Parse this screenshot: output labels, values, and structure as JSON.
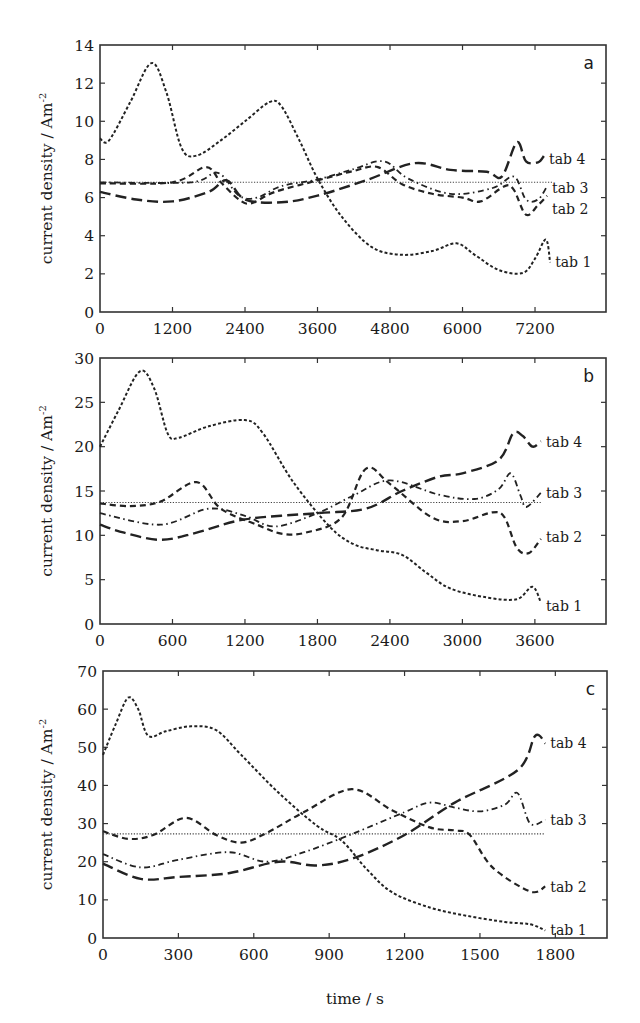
{
  "figure": {
    "x_axis_title": "time / s",
    "y_axis_title": "current density / Am",
    "y_axis_title_sup": "-2"
  },
  "chart_data": [
    {
      "type": "line",
      "panel": "a",
      "title": "",
      "xlabel": "",
      "ylabel": "current density / Am-2",
      "xlim": [
        0,
        8400
      ],
      "ylim": [
        0,
        14
      ],
      "xticks": [
        0,
        1200,
        2400,
        3600,
        4800,
        6000,
        7200
      ],
      "yticks": [
        0,
        2,
        4,
        6,
        8,
        10,
        12,
        14
      ],
      "grid": false,
      "legend": "inline labels at right end of curves",
      "reference_line": {
        "value": 6.8,
        "x_end": 7500,
        "style": "dotted"
      },
      "series": [
        {
          "name": "tab 1",
          "style": "short-dash",
          "label_value": 2.6,
          "points": [
            [
              0,
              9.1
            ],
            [
              150,
              9
            ],
            [
              500,
              11
            ],
            [
              850,
              13.05
            ],
            [
              1100,
              11.5
            ],
            [
              1350,
              8.6
            ],
            [
              1600,
              8.2
            ],
            [
              2000,
              9
            ],
            [
              2400,
              10
            ],
            [
              2800,
              11
            ],
            [
              3000,
              10.8
            ],
            [
              3300,
              9
            ],
            [
              3600,
              7
            ],
            [
              4000,
              5
            ],
            [
              4500,
              3.4
            ],
            [
              5000,
              3
            ],
            [
              5500,
              3.2
            ],
            [
              5900,
              3.6
            ],
            [
              6200,
              3
            ],
            [
              6600,
              2.2
            ],
            [
              7000,
              2.05
            ],
            [
              7200,
              2.8
            ],
            [
              7380,
              3.8
            ],
            [
              7450,
              2.6
            ]
          ]
        },
        {
          "name": "tab 2",
          "style": "medium-dash",
          "label_value": 5.4,
          "points": [
            [
              0,
              6.75
            ],
            [
              1200,
              6.8
            ],
            [
              1750,
              7.6
            ],
            [
              2000,
              6.8
            ],
            [
              2300,
              5.9
            ],
            [
              2500,
              5.7
            ],
            [
              2900,
              6.3
            ],
            [
              3600,
              6.9
            ],
            [
              4200,
              7.4
            ],
            [
              4600,
              7.6
            ],
            [
              5000,
              6.7
            ],
            [
              5500,
              6.2
            ],
            [
              6000,
              6
            ],
            [
              6300,
              5.8
            ],
            [
              6700,
              6.6
            ],
            [
              6850,
              6.4
            ],
            [
              7050,
              5.1
            ],
            [
              7250,
              5.6
            ],
            [
              7400,
              6.1
            ]
          ]
        },
        {
          "name": "tab 3",
          "style": "dash-dot",
          "label_value": 6.5,
          "points": [
            [
              0,
              6.8
            ],
            [
              1500,
              6.8
            ],
            [
              1950,
              7.3
            ],
            [
              2300,
              6.1
            ],
            [
              2600,
              6.0
            ],
            [
              3000,
              6.6
            ],
            [
              3600,
              6.95
            ],
            [
              4200,
              7.5
            ],
            [
              4700,
              7.9
            ],
            [
              5100,
              7.0
            ],
            [
              5800,
              6.2
            ],
            [
              6500,
              6.5
            ],
            [
              6850,
              7.1
            ],
            [
              7050,
              5.9
            ],
            [
              7250,
              5.9
            ],
            [
              7400,
              6.6
            ]
          ]
        },
        {
          "name": "tab 4",
          "style": "long-dash",
          "label_value": 8.0,
          "points": [
            [
              0,
              6.3
            ],
            [
              600,
              5.9
            ],
            [
              1200,
              5.8
            ],
            [
              1800,
              6.3
            ],
            [
              2100,
              6.9
            ],
            [
              2400,
              5.9
            ],
            [
              3000,
              5.75
            ],
            [
              3600,
              6.1
            ],
            [
              4400,
              6.9
            ],
            [
              5200,
              7.8
            ],
            [
              5800,
              7.45
            ],
            [
              6400,
              7.35
            ],
            [
              6650,
              7.1
            ],
            [
              6900,
              8.9
            ],
            [
              7050,
              7.9
            ],
            [
              7250,
              7.85
            ],
            [
              7350,
              8.2
            ]
          ]
        }
      ]
    },
    {
      "type": "line",
      "panel": "b",
      "title": "",
      "xlabel": "",
      "ylabel": "current density / Am-2",
      "xlim": [
        0,
        4200
      ],
      "ylim": [
        0,
        30
      ],
      "xticks": [
        0,
        600,
        1200,
        1800,
        2400,
        3000,
        3600
      ],
      "yticks": [
        0,
        5,
        10,
        15,
        20,
        25,
        30
      ],
      "grid": false,
      "legend": "inline labels at right end of curves",
      "reference_line": {
        "value": 13.7,
        "x_end": 3650,
        "style": "dotted"
      },
      "series": [
        {
          "name": "tab 1",
          "style": "short-dash",
          "label_value": 2.0,
          "points": [
            [
              0,
              20
            ],
            [
              150,
              24
            ],
            [
              330,
              28.5
            ],
            [
              450,
              26.5
            ],
            [
              560,
              21.5
            ],
            [
              650,
              21
            ],
            [
              900,
              22.3
            ],
            [
              1200,
              23
            ],
            [
              1350,
              21.5
            ],
            [
              1600,
              16
            ],
            [
              1900,
              11
            ],
            [
              2100,
              9
            ],
            [
              2300,
              8.3
            ],
            [
              2500,
              7.8
            ],
            [
              2700,
              5.8
            ],
            [
              2900,
              4
            ],
            [
              3200,
              3
            ],
            [
              3450,
              2.8
            ],
            [
              3580,
              4.2
            ],
            [
              3650,
              2.4
            ]
          ]
        },
        {
          "name": "tab 2",
          "style": "medium-dash",
          "label_value": 9.8,
          "points": [
            [
              0,
              13.6
            ],
            [
              250,
              13.3
            ],
            [
              500,
              13.8
            ],
            [
              800,
              16
            ],
            [
              1000,
              13
            ],
            [
              1300,
              11.2
            ],
            [
              1500,
              10.2
            ],
            [
              1700,
              10.3
            ],
            [
              2000,
              12
            ],
            [
              2200,
              17.5
            ],
            [
              2400,
              15.8
            ],
            [
              2750,
              12
            ],
            [
              3000,
              11.6
            ],
            [
              3250,
              12.6
            ],
            [
              3350,
              12
            ],
            [
              3450,
              8.6
            ],
            [
              3550,
              8
            ],
            [
              3650,
              9.6
            ]
          ]
        },
        {
          "name": "tab 3",
          "style": "dash-dot",
          "label_value": 14.8,
          "points": [
            [
              0,
              12.5
            ],
            [
              500,
              11.2
            ],
            [
              900,
              13
            ],
            [
              1200,
              12.2
            ],
            [
              1450,
              11
            ],
            [
              1800,
              12.5
            ],
            [
              2100,
              14.5
            ],
            [
              2400,
              16.2
            ],
            [
              2800,
              14.6
            ],
            [
              3100,
              14.1
            ],
            [
              3300,
              15.2
            ],
            [
              3400,
              17
            ],
            [
              3480,
              14.5
            ],
            [
              3530,
              13.2
            ],
            [
              3650,
              14.8
            ]
          ]
        },
        {
          "name": "tab 4",
          "style": "long-dash",
          "label_value": 20.5,
          "points": [
            [
              0,
              11.2
            ],
            [
              200,
              10.3
            ],
            [
              500,
              9.5
            ],
            [
              800,
              10.3
            ],
            [
              1200,
              11.8
            ],
            [
              1800,
              12.5
            ],
            [
              2200,
              13
            ],
            [
              2500,
              15
            ],
            [
              2800,
              16.6
            ],
            [
              3000,
              17
            ],
            [
              3300,
              18.5
            ],
            [
              3420,
              21.5
            ],
            [
              3500,
              21.2
            ],
            [
              3580,
              20
            ],
            [
              3650,
              20.6
            ]
          ]
        }
      ]
    },
    {
      "type": "line",
      "panel": "c",
      "title": "",
      "xlabel": "time / s",
      "ylabel": "current density / Am-2",
      "xlim": [
        0,
        2000
      ],
      "ylim": [
        0,
        70
      ],
      "xticks": [
        0,
        300,
        600,
        900,
        1200,
        1500,
        1800
      ],
      "yticks": [
        0,
        10,
        20,
        30,
        40,
        50,
        60,
        70
      ],
      "grid": false,
      "legend": "inline labels at right end of curves",
      "reference_line": {
        "value": 27.3,
        "x_end": 1760,
        "style": "dotted"
      },
      "series": [
        {
          "name": "tab 1",
          "style": "short-dash",
          "label_value": 2.0,
          "points": [
            [
              0,
              48
            ],
            [
              50,
              56
            ],
            [
              100,
              63
            ],
            [
              140,
              60
            ],
            [
              180,
              53
            ],
            [
              250,
              54.2
            ],
            [
              350,
              55.5
            ],
            [
              450,
              54.5
            ],
            [
              550,
              48
            ],
            [
              700,
              38
            ],
            [
              850,
              29.5
            ],
            [
              950,
              25.5
            ],
            [
              1050,
              18
            ],
            [
              1150,
              12
            ],
            [
              1300,
              8
            ],
            [
              1450,
              5.8
            ],
            [
              1600,
              4.2
            ],
            [
              1700,
              3.6
            ],
            [
              1760,
              2
            ]
          ]
        },
        {
          "name": "tab 2",
          "style": "medium-dash",
          "label_value": 13.5,
          "points": [
            [
              0,
              28
            ],
            [
              100,
              26
            ],
            [
              200,
              27
            ],
            [
              330,
              31.5
            ],
            [
              450,
              27
            ],
            [
              550,
              25
            ],
            [
              650,
              27.5
            ],
            [
              800,
              33
            ],
            [
              990,
              39
            ],
            [
              1150,
              33.5
            ],
            [
              1300,
              29
            ],
            [
              1400,
              28.2
            ],
            [
              1460,
              27
            ],
            [
              1550,
              18.5
            ],
            [
              1700,
              12.2
            ],
            [
              1760,
              13.5
            ]
          ]
        },
        {
          "name": "tab 3",
          "style": "dash-dot",
          "label_value": 31.0,
          "points": [
            [
              0,
              22
            ],
            [
              150,
              18.5
            ],
            [
              300,
              20.5
            ],
            [
              500,
              22.5
            ],
            [
              650,
              20
            ],
            [
              800,
              22.5
            ],
            [
              1000,
              27.5
            ],
            [
              1200,
              33
            ],
            [
              1300,
              35.5
            ],
            [
              1400,
              34.2
            ],
            [
              1500,
              33.2
            ],
            [
              1600,
              35
            ],
            [
              1650,
              38
            ],
            [
              1700,
              30
            ],
            [
              1760,
              31
            ]
          ]
        },
        {
          "name": "tab 4",
          "style": "long-dash",
          "label_value": 51.0,
          "points": [
            [
              0,
              19.5
            ],
            [
              150,
              15.5
            ],
            [
              300,
              16
            ],
            [
              500,
              17
            ],
            [
              700,
              20
            ],
            [
              850,
              19
            ],
            [
              1000,
              21
            ],
            [
              1200,
              27
            ],
            [
              1400,
              35.5
            ],
            [
              1650,
              44
            ],
            [
              1720,
              53
            ],
            [
              1760,
              51
            ]
          ]
        }
      ]
    }
  ],
  "panels": [
    {
      "letter": "a",
      "box": {
        "left": 100,
        "top": 45,
        "right": 606,
        "bottom": 312
      }
    },
    {
      "letter": "b",
      "box": {
        "left": 100,
        "top": 358,
        "right": 606,
        "bottom": 624
      }
    },
    {
      "letter": "c",
      "box": {
        "left": 103,
        "top": 671,
        "right": 607,
        "bottom": 938
      }
    }
  ],
  "panel_x_scale": [
    {
      "px_per_unit": 0.06042
    },
    {
      "px_per_unit": 0.1208
    },
    {
      "px_per_unit": 0.2513
    }
  ]
}
